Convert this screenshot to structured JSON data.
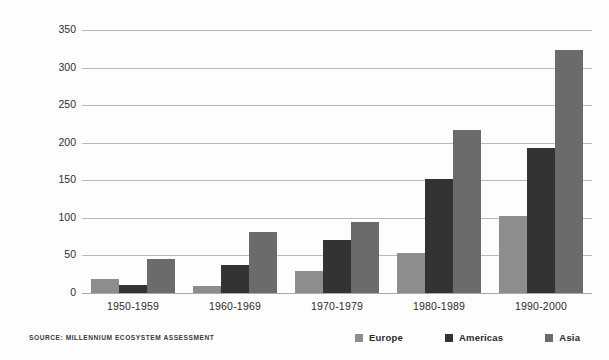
{
  "chart_data": {
    "type": "bar",
    "title": "",
    "xlabel": "",
    "ylabel": "Number of major floods",
    "categories": [
      "1950-1959",
      "1960-1969",
      "1970-1979",
      "1980-1989",
      "1990-2000"
    ],
    "series": [
      {
        "name": "Europe",
        "color": "#8d8d8d",
        "values": [
          19,
          9,
          29,
          53,
          103
        ]
      },
      {
        "name": "Americas",
        "color": "#333333",
        "values": [
          11,
          37,
          71,
          152,
          193
        ]
      },
      {
        "name": "Asia",
        "color": "#6b6b6b",
        "values": [
          45,
          81,
          94,
          217,
          323
        ]
      }
    ],
    "ylim": [
      0,
      350
    ],
    "yticks": [
      0,
      50,
      100,
      150,
      200,
      250,
      300,
      350
    ],
    "grid": true,
    "legend_position": "bottom-right"
  },
  "source": "SOURCE: MILLENNIUM ECOSYSTEM ASSESSMENT"
}
